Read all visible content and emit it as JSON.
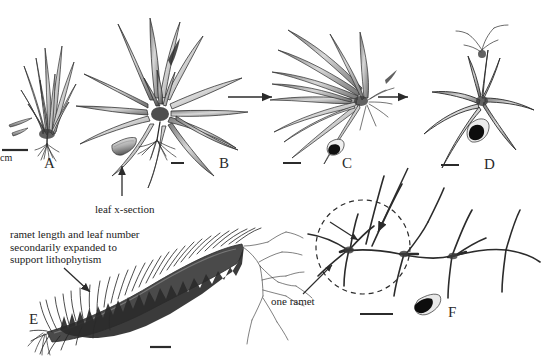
{
  "figure": {
    "type": "scientific-illustration",
    "background_color": "#ffffff",
    "ink_color": "#2b2b2b"
  },
  "panels": [
    {
      "id": "A",
      "label": "A",
      "x": 44,
      "y": 155,
      "caption": "compact rosette ramet, erect imbricate leaves"
    },
    {
      "id": "B",
      "label": "B",
      "x": 219,
      "y": 155,
      "caption": "expanded rosette with spreading recurved leaves"
    },
    {
      "id": "C",
      "label": "C",
      "x": 342,
      "y": 155,
      "caption": "reduced rosette, narrow elongate leaves"
    },
    {
      "id": "D",
      "label": "D",
      "x": 484,
      "y": 156,
      "caption": "sparse few-leaved ramet"
    },
    {
      "id": "E",
      "label": "E",
      "x": 29,
      "y": 311,
      "caption": "elongate caulescent ramet with dense leaves and roots"
    },
    {
      "id": "F",
      "label": "F",
      "x": 448,
      "y": 304,
      "caption": "chain of ramets, leaves highly reduced"
    }
  ],
  "annotations": [
    {
      "name": "leaf-x-section-label",
      "text": "leaf x-section",
      "x": 95,
      "y": 203,
      "points_to": "leaf cross-section inset in panel B"
    },
    {
      "name": "lithophytism-note",
      "text": "ramet length and leaf number\nsecondarily expanded to\nsupport lithophytism",
      "x": 10,
      "y": 228,
      "points_to": "panel E"
    },
    {
      "name": "one-ramet-label",
      "text": "one ramet",
      "x": 271,
      "y": 295,
      "points_to": "dashed circle in panel F"
    }
  ],
  "scale_bars": [
    {
      "panel": "A",
      "x": 2,
      "y": 150,
      "width": 26,
      "label": "cm",
      "label_x": 1,
      "label_y": 153
    },
    {
      "panel": "B",
      "x": 171,
      "y": 163,
      "width": 13,
      "label": "",
      "label_x": 0,
      "label_y": 0
    },
    {
      "panel": "C",
      "x": 283,
      "y": 163,
      "width": 18,
      "label": "",
      "label_x": 0,
      "label_y": 0
    },
    {
      "panel": "D",
      "x": 441,
      "y": 165,
      "width": 18,
      "label": "",
      "label_x": 0,
      "label_y": 0
    },
    {
      "panel": "E",
      "x": 150,
      "y": 347,
      "width": 21,
      "label": "",
      "label_x": 0,
      "label_y": 0
    },
    {
      "panel": "F",
      "x": 360,
      "y": 314,
      "width": 33,
      "label": "",
      "label_x": 0,
      "label_y": 0
    }
  ],
  "arrows": [
    {
      "name": "arrow-b-to-c",
      "from_panel": "B",
      "to_panel": "C",
      "x1": 228,
      "y1": 97,
      "x2": 272,
      "y2": 97
    },
    {
      "name": "arrow-c-to-d",
      "from_panel": "C",
      "to_panel": "D",
      "x1": 378,
      "y1": 97,
      "x2": 408,
      "y2": 97
    },
    {
      "name": "arrow-d-to-f",
      "from_panel": "D",
      "to_panel": "F",
      "x1": 408,
      "y1": 168,
      "x2": 378,
      "y2": 232
    },
    {
      "name": "arrow-xsection-pointer",
      "from_panel": "label",
      "to_panel": "B",
      "x1": 122,
      "y1": 197,
      "x2": 122,
      "y2": 166
    },
    {
      "name": "arrow-lithophytism-pointer",
      "from_panel": "label",
      "to_panel": "E",
      "x1": 64,
      "y1": 268,
      "x2": 88,
      "y2": 291
    },
    {
      "name": "arrow-one-ramet-pointer",
      "from_panel": "label",
      "to_panel": "F",
      "x1": 303,
      "y1": 294,
      "x2": 332,
      "y2": 265
    },
    {
      "name": "arrow-internal-ramet-b",
      "from_panel": "F",
      "to_panel": "F",
      "x1": 330,
      "y1": 222,
      "x2": 358,
      "y2": 240
    }
  ],
  "inset_xsections": [
    {
      "name": "leaf-xsection-a",
      "panel": "A",
      "x": 12,
      "y": 120,
      "kind": "flat-elongate-pale"
    },
    {
      "name": "leaf-xsection-b",
      "panel": "B",
      "x": 121,
      "y": 150,
      "kind": "flat-elongate-pale"
    },
    {
      "name": "leaf-xsection-c",
      "panel": "C",
      "x": 327,
      "y": 147,
      "kind": "terete-dark-teardrop"
    },
    {
      "name": "leaf-xsection-d",
      "panel": "D",
      "x": 472,
      "y": 129,
      "kind": "terete-dark-teardrop"
    },
    {
      "name": "leaf-xsection-f",
      "panel": "F",
      "x": 411,
      "y": 298,
      "kind": "terete-dark-teardrop"
    }
  ],
  "dashed_circle": {
    "name": "one-ramet-highlight",
    "cx": 363,
    "cy": 247,
    "r": 47
  }
}
